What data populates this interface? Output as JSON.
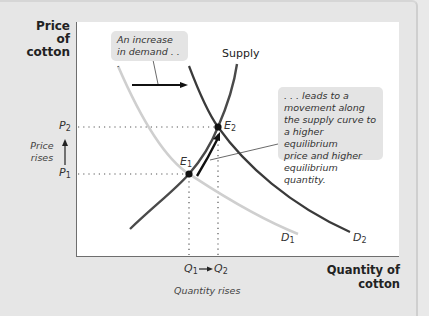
{
  "axes": {
    "y_label_line1": "Price",
    "y_label_line2": "of cotton",
    "x_label": "Quantity of cotton"
  },
  "curves": {
    "supply_label": "Supply",
    "d1_label": "D",
    "d1_sub": "1",
    "d2_label": "D",
    "d2_sub": "2",
    "colors": {
      "supply": "#4a4a4a",
      "d1": "#cfcfcf",
      "d2": "#3a3a3a"
    }
  },
  "points": {
    "e1_label": "E",
    "e1_sub": "1",
    "e2_label": "E",
    "e2_sub": "2"
  },
  "ticks": {
    "p1": "P",
    "p1_sub": "1",
    "p2": "P",
    "p2_sub": "2",
    "q1": "Q",
    "q1_sub": "1",
    "q2": "Q",
    "q2_sub": "2"
  },
  "annotations": {
    "price_rises_line1": "Price",
    "price_rises_line2": "rises",
    "quantity_rises": "Quantity rises",
    "demand_callout_line1": "An increase",
    "demand_callout_line2": "in demand . . .",
    "movement_callout": [
      ". . . leads to a",
      "movement along",
      "the supply curve to",
      "a higher equilibrium",
      "price and higher",
      "equilibrium quantity."
    ]
  }
}
